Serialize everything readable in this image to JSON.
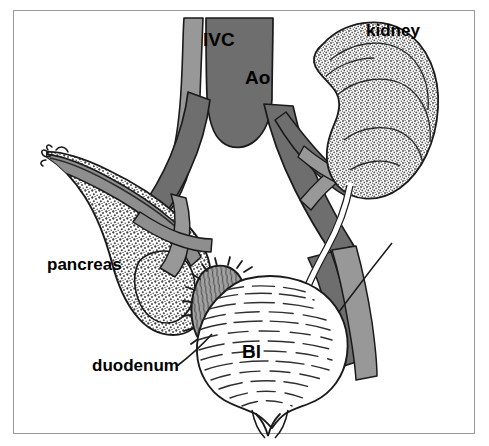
{
  "figure": {
    "type": "anatomical-line-drawing",
    "background_color": "#ffffff",
    "frame_color": "#9a9a9a"
  },
  "labels": {
    "ivc": "IVC",
    "aorta": "Ao",
    "kidney": "kidney",
    "pancreas": "pancreas",
    "duodenum": "duodenum",
    "bladder": "Bl"
  },
  "colors": {
    "artery_dark_gray": "#6e6e6e",
    "vein_light_gray": "#989898",
    "duodenum_gray": "#9c9c9c",
    "organ_white": "#ffffff",
    "outline_black": "#1a1a1a",
    "stipple_gray": "#555555",
    "hatch_gray": "#333333"
  },
  "structures": [
    {
      "name": "inferior-vena-cava",
      "label": "IVC",
      "shade": "light-gray"
    },
    {
      "name": "abdominal-aorta",
      "label": "Ao",
      "shade": "dark-gray"
    },
    {
      "name": "right-kidney",
      "label": "kidney",
      "shade": "stippled"
    },
    {
      "name": "pancreas",
      "label": "pancreas",
      "shade": "stippled"
    },
    {
      "name": "duodenum",
      "label": "duodenum",
      "shade": "mid-gray-folds"
    },
    {
      "name": "urinary-bladder",
      "label": "Bl",
      "shade": "white-hatched"
    },
    {
      "name": "renal-artery",
      "label": "",
      "shade": "dark-gray"
    },
    {
      "name": "renal-vein",
      "label": "",
      "shade": "light-gray"
    },
    {
      "name": "ureter",
      "label": "",
      "shade": "white"
    },
    {
      "name": "common-iliac-artery-left",
      "label": "",
      "shade": "dark-gray"
    },
    {
      "name": "common-iliac-artery-right",
      "label": "",
      "shade": "dark-gray"
    },
    {
      "name": "splenic-vessel",
      "label": "",
      "shade": "light-gray"
    },
    {
      "name": "superior-mesenteric-vessels",
      "label": "",
      "shade": "light-gray"
    }
  ],
  "leader_lines": [
    {
      "from": "duodenum-label",
      "to": "duodenum"
    }
  ]
}
